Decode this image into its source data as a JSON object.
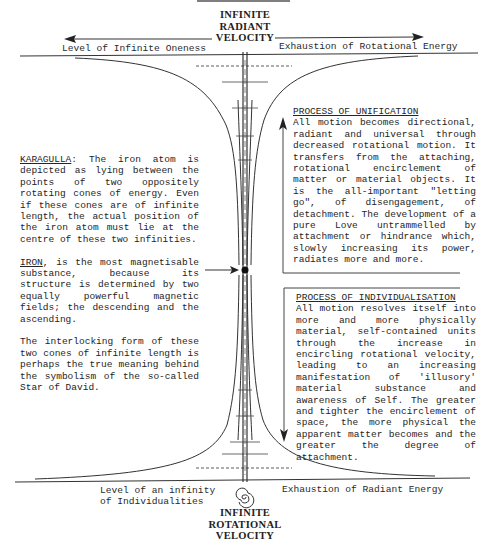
{
  "top": {
    "title_lines": [
      "INFINITE",
      "RADIANT",
      "VELOCITY"
    ],
    "left_label": "Level of Infinite Oneness",
    "right_label": "Exhaustion of Rotational Energy",
    "left_arrow": "arrow-left",
    "right_arrow": "arrow-right"
  },
  "bottom": {
    "title_lines": [
      "INFINITE",
      "ROTATIONAL",
      "VELOCITY"
    ],
    "left_label_lines": [
      "Level of an infinity",
      "of Individualities"
    ],
    "right_label": "Exhaustion of Radiant Energy",
    "symbol": "spiral"
  },
  "left_column": {
    "karagulla": {
      "heading": "KARAGULLA",
      "text": ":  The iron atom is depicted as lying between the points of two oppositely rotating cones of energy.  Even if these cones are of infinite length, the actual position of the iron atom must lie at the centre of these two infinities."
    },
    "iron": {
      "heading": "IRON",
      "text": ", is the most magnetisable substance, because its structure is determined by two equally powerful magnetic fields; the descending and the ascending."
    },
    "interlocking": {
      "text": "The interlocking form of these two cones of infinite length is perhaps the true meaning behind the symbolism of the so-called Star of David."
    }
  },
  "right_column": {
    "unification": {
      "heading": "PROCESS OF UNIFICATION",
      "text": "All motion becomes directional, radiant and universal through decreased rotational motion.  It transfers from the attaching, rotational encirclement of matter or material objects.  It is the all-important \"letting go\", of disengagement, of detachment. The development of a pure Love untrammelled by attachment or hindrance which, slowly increasing its power, radiates more and more.",
      "arrow": "arrow-up"
    },
    "individualisation": {
      "heading": "PROCESS OF INDIVIDUALISATION",
      "text": "All motion resolves itself into more and more physically material, self-contained units through the increase in encircling rotational velocity, leading to an increasing manifestation of 'illusory' material substance and awareness of Self.  The greater and tighter the encirclement of space, the more physical the apparent matter becomes and the greater the degree of attachment.",
      "arrow": "arrow-down"
    }
  },
  "diagram": {
    "centre_marker": "iron-atom-dot",
    "pointer_arrow": "arrow-right",
    "colors": {
      "ink": "#2a2a2a",
      "background": "#ffffff"
    }
  }
}
